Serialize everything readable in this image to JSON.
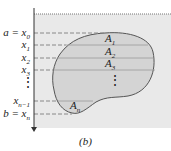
{
  "figure": {
    "caption": "(b)",
    "colors": {
      "background": "#ffffff",
      "fluid": "#e9e9e9",
      "region": "#d4d4d4",
      "outline": "#555555",
      "dashed": "#888888",
      "slice_line": "#999999",
      "axis": "#333333"
    },
    "axis": {
      "direction": "downward",
      "labels": [
        {
          "id": "x0",
          "text": "a = x",
          "sub": "0"
        },
        {
          "id": "x1",
          "text": "x",
          "sub": "1"
        },
        {
          "id": "x2",
          "text": "x",
          "sub": "2"
        },
        {
          "id": "x3",
          "text": "x",
          "sub": "3"
        },
        {
          "id": "dots",
          "text": "⋮",
          "sub": ""
        },
        {
          "id": "xn1",
          "text": "x",
          "sub": "n−1"
        },
        {
          "id": "xn",
          "text": "b = x",
          "sub": "n"
        }
      ]
    },
    "strips": [
      {
        "text": "A",
        "sub": "1"
      },
      {
        "text": "A",
        "sub": "2"
      },
      {
        "text": "A",
        "sub": "3"
      },
      {
        "text": "⋮",
        "sub": ""
      },
      {
        "text": "A",
        "sub": "n"
      }
    ]
  }
}
